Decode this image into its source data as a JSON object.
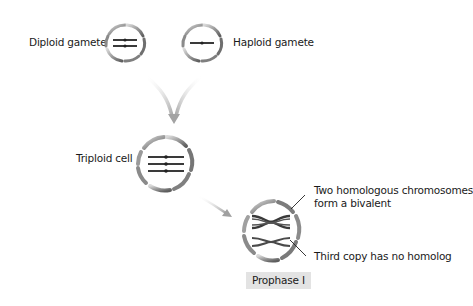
{
  "diagram": {
    "nodes": {
      "diploid_gamete": {
        "label": "Diploid gamete",
        "chromosomes": 2
      },
      "haploid_gamete": {
        "label": "Haploid gamete",
        "chromosomes": 1
      },
      "triploid_cell": {
        "label": "Triploid cell",
        "chromosomes": 3
      },
      "prophase_cell": {
        "stage_label": "Prophase I",
        "annotations": {
          "bivalent": "Two homologous chromosomes form a bivalent",
          "bivalent_line1": "Two homologous chromosomes",
          "bivalent_line2": "form a bivalent",
          "univalent": "Third copy has no homolog"
        }
      }
    },
    "flows": [
      {
        "from": [
          "diploid_gamete",
          "haploid_gamete"
        ],
        "to": "triploid_cell",
        "type": "merge-arrow"
      },
      {
        "from": "triploid_cell",
        "to": "prophase_cell",
        "type": "arrow"
      }
    ],
    "colors": {
      "membrane": "#8a8a8a",
      "membrane_dark": "#555555",
      "chromosome": "#3a3a3a",
      "arrow": "#b5b5b5",
      "label_box": "#e3e3e3"
    }
  }
}
